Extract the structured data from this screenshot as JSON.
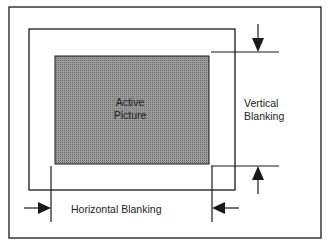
{
  "diagram": {
    "active_picture": {
      "line1": "Active",
      "line2": "Picture"
    },
    "vertical_blanking": {
      "line1": "Vertical",
      "line2": "Blanking"
    },
    "horizontal_blanking": "Horizontal Blanking",
    "colors": {
      "line": "#1a1a1a",
      "active_fill": "#8a8a8a",
      "background": "#ffffff"
    }
  }
}
